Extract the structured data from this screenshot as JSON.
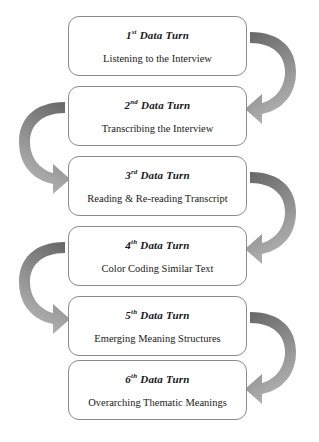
{
  "diagram": {
    "orientation": "vertical-serpentine",
    "box_count": 6,
    "arrow_count": 5,
    "colors": {
      "box_border": "#8a8a8a",
      "box_fill": "#ffffff",
      "text": "#17171c",
      "arrow_dark": "#6e6e6e",
      "arrow_mid": "#8f8f8f",
      "arrow_light": "#aaaaaa",
      "background": "#ffffff"
    },
    "steps": [
      {
        "index": "1",
        "ordinal_suffix": "st",
        "title_tail": " Data Turn",
        "description": "Listening to the Interview"
      },
      {
        "index": "2",
        "ordinal_suffix": "nd",
        "title_tail": " Data Turn",
        "description": "Transcribing the Interview"
      },
      {
        "index": "3",
        "ordinal_suffix": "rd",
        "title_tail": " Data Turn",
        "description": "Reading & Re-reading Transcript"
      },
      {
        "index": "4",
        "ordinal_suffix": "th",
        "title_tail": " Data Turn",
        "description": "Color Coding Similar Text"
      },
      {
        "index": "5",
        "ordinal_suffix": "th",
        "title_tail": " Data Turn",
        "description": "Emerging Meaning Structures"
      },
      {
        "index": "6",
        "ordinal_suffix": "th",
        "title_tail": " Data Turn",
        "description": "Overarching Thematic Meanings"
      }
    ],
    "arrows": [
      {
        "name": "arrow-step1-to-step2",
        "side": "right",
        "from": "1",
        "to": "2"
      },
      {
        "name": "arrow-step2-to-step3",
        "side": "left",
        "from": "2",
        "to": "3"
      },
      {
        "name": "arrow-step3-to-step4",
        "side": "right",
        "from": "3",
        "to": "4"
      },
      {
        "name": "arrow-step4-to-step5",
        "side": "left",
        "from": "4",
        "to": "5"
      },
      {
        "name": "arrow-step5-to-step6",
        "side": "right",
        "from": "5",
        "to": "6"
      }
    ]
  }
}
